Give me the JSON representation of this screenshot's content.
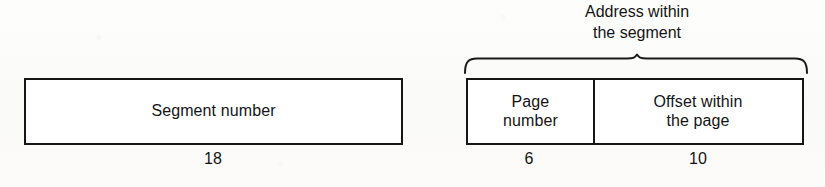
{
  "diagram": {
    "title": "Address within the segment",
    "caption": {
      "line1": "Address within",
      "line2": "the segment"
    },
    "fields": [
      {
        "key": "segment_number",
        "label": "Segment number",
        "bits": "18"
      },
      {
        "key": "page_number",
        "label_line1": "Page",
        "label_line2": "number",
        "bits": "6"
      },
      {
        "key": "offset_within_page",
        "label_line1": "Offset within",
        "label_line2": "the page",
        "bits": "10"
      }
    ],
    "icons": {
      "brace": "curly-brace-up-icon"
    },
    "colors": {
      "ink": "#161616",
      "paper": "#fcfcfb",
      "box_fill": "#ffffff"
    }
  }
}
